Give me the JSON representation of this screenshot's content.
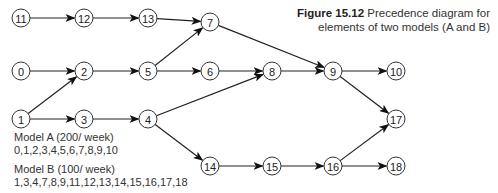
{
  "caption": {
    "figure_label": "Figure 15.12",
    "title_line1": "Precedence diagram for",
    "title_line2": "elements of two models (A and B)"
  },
  "models": [
    {
      "name": "Model A (200/ week)",
      "elements": "0,1,2,3,4,5,6,7,8,9,10"
    },
    {
      "name": "Model B (100/ week)",
      "elements": "1,3,4,7,8,9,11,12,13,14,15,16,17,18"
    }
  ],
  "nodes": [
    {
      "id": "11",
      "x": 21,
      "y": 18
    },
    {
      "id": "12",
      "x": 84,
      "y": 18
    },
    {
      "id": "13",
      "x": 148,
      "y": 18
    },
    {
      "id": "7",
      "x": 210,
      "y": 22
    },
    {
      "id": "0",
      "x": 21,
      "y": 71
    },
    {
      "id": "2",
      "x": 84,
      "y": 71
    },
    {
      "id": "5",
      "x": 148,
      "y": 71
    },
    {
      "id": "6",
      "x": 210,
      "y": 71
    },
    {
      "id": "8",
      "x": 272,
      "y": 71
    },
    {
      "id": "9",
      "x": 333,
      "y": 71
    },
    {
      "id": "10",
      "x": 396,
      "y": 71
    },
    {
      "id": "1",
      "x": 21,
      "y": 119
    },
    {
      "id": "3",
      "x": 84,
      "y": 119
    },
    {
      "id": "4",
      "x": 148,
      "y": 119
    },
    {
      "id": "17",
      "x": 396,
      "y": 119
    },
    {
      "id": "14",
      "x": 210,
      "y": 166
    },
    {
      "id": "15",
      "x": 272,
      "y": 166
    },
    {
      "id": "16",
      "x": 333,
      "y": 166
    },
    {
      "id": "18",
      "x": 396,
      "y": 166
    }
  ],
  "edges": [
    [
      "11",
      "12"
    ],
    [
      "12",
      "13"
    ],
    [
      "13",
      "7"
    ],
    [
      "5",
      "7"
    ],
    [
      "7",
      "9"
    ],
    [
      "0",
      "2"
    ],
    [
      "1",
      "2"
    ],
    [
      "2",
      "5"
    ],
    [
      "5",
      "6"
    ],
    [
      "6",
      "8"
    ],
    [
      "8",
      "9"
    ],
    [
      "9",
      "10"
    ],
    [
      "1",
      "3"
    ],
    [
      "3",
      "4"
    ],
    [
      "4",
      "8"
    ],
    [
      "4",
      "14"
    ],
    [
      "9",
      "17"
    ],
    [
      "14",
      "15"
    ],
    [
      "15",
      "16"
    ],
    [
      "16",
      "17"
    ],
    [
      "16",
      "18"
    ]
  ]
}
